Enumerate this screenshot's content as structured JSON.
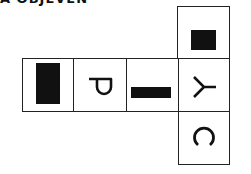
{
  "heading": {
    "text": "A OBJEVEN",
    "clipped": true
  },
  "net": {
    "cells": [
      {
        "id": "top",
        "content": "black-square"
      },
      {
        "id": "left",
        "content": "black-vertical-rectangle"
      },
      {
        "id": "middle-left",
        "content": "letter",
        "letter": "P",
        "rotation_deg": 90
      },
      {
        "id": "middle-right",
        "content": "black-horizontal-bar"
      },
      {
        "id": "center",
        "content": "letter",
        "letter": "Y",
        "rotation_deg": 90
      },
      {
        "id": "bottom",
        "content": "letter",
        "letter": "C",
        "rotation_deg": 90
      }
    ],
    "colors": {
      "line": "#222222",
      "fill": "#111111",
      "background": "#ffffff"
    }
  }
}
